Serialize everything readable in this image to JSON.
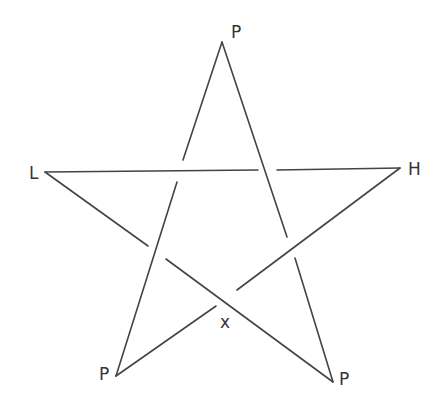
{
  "diagram": {
    "type": "knot-diagram",
    "shape": "pentagram",
    "colors": {
      "line": "#444444",
      "label": "#333333",
      "background": "#ffffff"
    },
    "labels": {
      "top": "P",
      "left": "L",
      "right": "H",
      "center_bottom": "x",
      "bottom_left": "P",
      "bottom_right": "P"
    },
    "vertices": {
      "top": [
        222,
        42
      ],
      "left": [
        45,
        172
      ],
      "right": [
        400,
        168
      ],
      "bottom_left": [
        116,
        376
      ],
      "bottom_right": [
        333,
        382
      ]
    },
    "crossings": [
      {
        "id": "upper-left",
        "over": "L-H",
        "under": "top-bottom_left"
      },
      {
        "id": "upper-right",
        "over": "top-bottom_right",
        "under": "L-H"
      },
      {
        "id": "lower-left",
        "over": "top-bottom_left",
        "under": "L-bottom_right"
      },
      {
        "id": "lower-right",
        "over": "H-bottom_left",
        "under": "top-bottom_right"
      },
      {
        "id": "bottom-center",
        "over": "L-bottom_right",
        "under": "H-bottom_left"
      }
    ]
  }
}
